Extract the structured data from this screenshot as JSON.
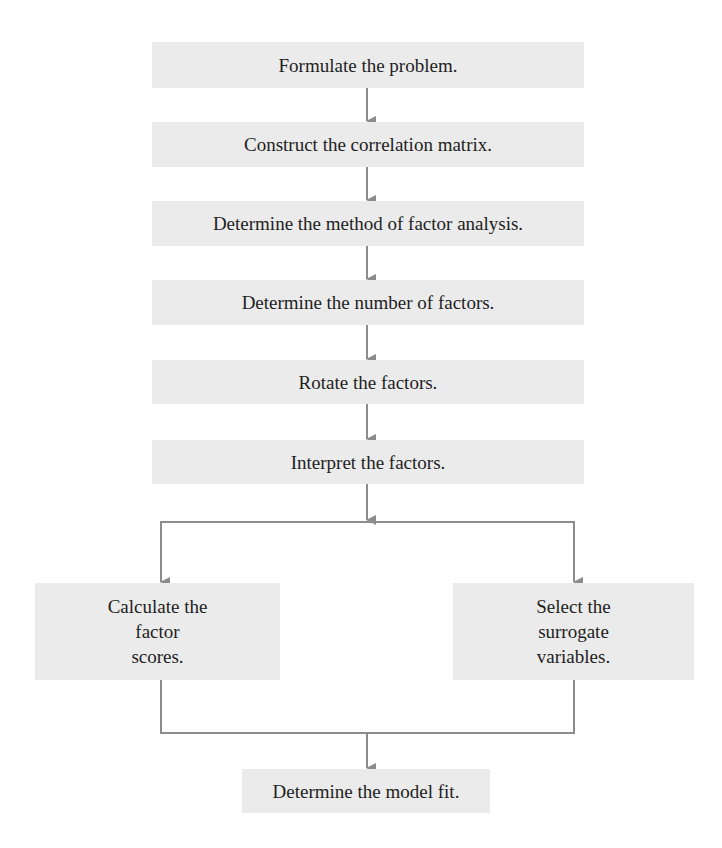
{
  "diagram": {
    "type": "flowchart",
    "colors": {
      "box_fill": "#ebebeb",
      "connector": "#8c8c8c",
      "text": "#1e1e1e",
      "background": "#ffffff"
    },
    "steps": [
      {
        "id": "formulate",
        "label": "Formulate the problem."
      },
      {
        "id": "correlation",
        "label": "Construct the correlation matrix."
      },
      {
        "id": "method",
        "label": "Determine the method of factor analysis."
      },
      {
        "id": "number",
        "label": "Determine the number of factors."
      },
      {
        "id": "rotate",
        "label": "Rotate the factors."
      },
      {
        "id": "interpret",
        "label": "Interpret the factors."
      }
    ],
    "branches": [
      {
        "id": "scores",
        "label": "Calculate the\nfactor\nscores."
      },
      {
        "id": "surrogate",
        "label": "Select the\nsurrogate\nvariables."
      }
    ],
    "final": {
      "id": "model-fit",
      "label": "Determine the model fit."
    },
    "edges": [
      [
        "formulate",
        "correlation"
      ],
      [
        "correlation",
        "method"
      ],
      [
        "method",
        "number"
      ],
      [
        "number",
        "rotate"
      ],
      [
        "rotate",
        "interpret"
      ],
      [
        "interpret",
        "scores"
      ],
      [
        "interpret",
        "surrogate"
      ],
      [
        "scores",
        "model-fit"
      ],
      [
        "surrogate",
        "model-fit"
      ]
    ]
  }
}
